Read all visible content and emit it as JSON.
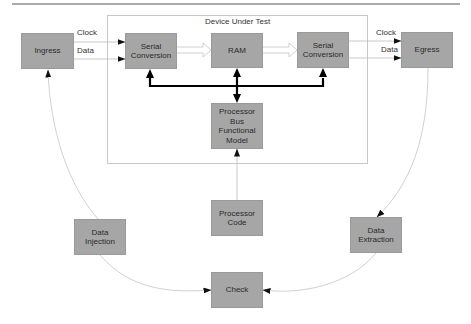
{
  "diagram": {
    "container": {
      "title": "Device Under Test"
    },
    "nodes": {
      "ingress": "Ingress",
      "serial_in": "Serial\nConversion",
      "ram": "RAM",
      "serial_out": "Serial\nConversion",
      "egress": "Egress",
      "bfm": "Processor\nBus\nFunctional\nModel",
      "proc_code": "Processor\nCode",
      "data_injection": "Data\nInjection",
      "data_extraction": "Data\nExtraction",
      "check": "Check"
    },
    "edge_labels": {
      "in_clock": "Clock",
      "in_data": "Data",
      "out_clock": "Clock",
      "out_data": "Data"
    },
    "edges": [
      {
        "from": "Ingress",
        "to": "Serial Conversion (in)",
        "label": "Clock",
        "style": "thin-arrow"
      },
      {
        "from": "Ingress",
        "to": "Serial Conversion (in)",
        "label": "Data",
        "style": "thin-arrow"
      },
      {
        "from": "Serial Conversion (in)",
        "to": "RAM",
        "style": "hollow-arrow"
      },
      {
        "from": "RAM",
        "to": "Serial Conversion (out)",
        "style": "hollow-arrow"
      },
      {
        "from": "Serial Conversion (out)",
        "to": "Egress",
        "label": "Clock",
        "style": "thin-arrow"
      },
      {
        "from": "Serial Conversion (out)",
        "to": "Egress",
        "label": "Data",
        "style": "thin-arrow"
      },
      {
        "from": "Processor Bus Functional Model",
        "to": "Serial Conversion (in)",
        "style": "bold-bus"
      },
      {
        "from": "Processor Bus Functional Model",
        "to": "RAM",
        "style": "bold-bus-bidirectional"
      },
      {
        "from": "Processor Bus Functional Model",
        "to": "Serial Conversion (out)",
        "style": "bold-bus"
      },
      {
        "from": "Processor Code",
        "to": "Processor Bus Functional Model",
        "style": "thin-arrow"
      },
      {
        "from": "Data Injection",
        "to": "Ingress",
        "style": "curved-arrow"
      },
      {
        "from": "Data Injection",
        "to": "Check",
        "style": "curved-arrow"
      },
      {
        "from": "Egress",
        "to": "Data Extraction",
        "style": "curved-arrow"
      },
      {
        "from": "Data Extraction",
        "to": "Check",
        "style": "curved-arrow"
      }
    ]
  }
}
